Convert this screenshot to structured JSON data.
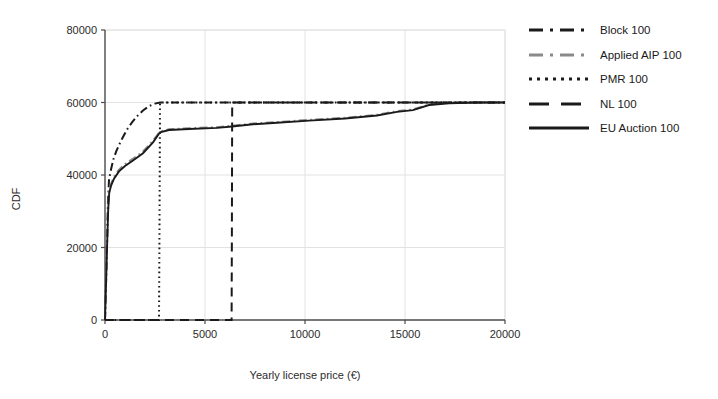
{
  "chart_data": {
    "type": "line",
    "title": "",
    "xlabel": "Yearly license price (€)",
    "ylabel": "CDF",
    "xlim": [
      0,
      20000
    ],
    "ylim": [
      0,
      80000
    ],
    "xticks": [
      0,
      5000,
      10000,
      15000,
      20000
    ],
    "yticks": [
      0,
      20000,
      40000,
      60000,
      80000
    ],
    "xtick_labels": [
      "0",
      "5000",
      "10000",
      "15000",
      "20000"
    ],
    "ytick_labels": [
      "0",
      "20000",
      "40000",
      "60000",
      "80000"
    ],
    "grid": true,
    "legend_position": "right",
    "series": [
      {
        "name": "Block 100",
        "style": "dashdot",
        "color": "#1a1a1a",
        "points": [
          [
            0,
            0
          ],
          [
            60,
            12000
          ],
          [
            110,
            24000
          ],
          [
            150,
            33000
          ],
          [
            200,
            38500
          ],
          [
            260,
            40500
          ],
          [
            340,
            42500
          ],
          [
            430,
            44500
          ],
          [
            560,
            46500
          ],
          [
            720,
            48500
          ],
          [
            900,
            50500
          ],
          [
            1100,
            52500
          ],
          [
            1350,
            54500
          ],
          [
            1600,
            56200
          ],
          [
            1900,
            57800
          ],
          [
            2200,
            59000
          ],
          [
            2500,
            59700
          ],
          [
            2750,
            60000
          ],
          [
            6350,
            60000
          ],
          [
            12000,
            60000
          ],
          [
            20000,
            60000
          ]
        ]
      },
      {
        "name": "Applied AIP 100",
        "style": "dashdot",
        "color": "#8a8a8a",
        "points": [
          [
            0,
            0
          ],
          [
            50,
            10000
          ],
          [
            110,
            22000
          ],
          [
            160,
            31000
          ],
          [
            210,
            35500
          ],
          [
            300,
            37500
          ],
          [
            450,
            39500
          ],
          [
            700,
            41500
          ],
          [
            1000,
            43000
          ],
          [
            1400,
            44500
          ],
          [
            1900,
            46500
          ],
          [
            2400,
            49500
          ],
          [
            2750,
            52000
          ],
          [
            3200,
            52600
          ],
          [
            4200,
            52900
          ],
          [
            5600,
            53200
          ],
          [
            6350,
            53600
          ],
          [
            7400,
            54200
          ],
          [
            8600,
            54600
          ],
          [
            10200,
            55200
          ],
          [
            12000,
            55800
          ],
          [
            13600,
            56600
          ],
          [
            14600,
            57600
          ],
          [
            15400,
            58100
          ],
          [
            16200,
            59400
          ],
          [
            17200,
            59900
          ],
          [
            18600,
            60000
          ],
          [
            20000,
            60000
          ]
        ]
      },
      {
        "name": "PMR 100",
        "style": "dotted",
        "color": "#1a1a1a",
        "points": [
          [
            0,
            0
          ],
          [
            2700,
            0
          ],
          [
            2720,
            20000
          ],
          [
            2740,
            45000
          ],
          [
            2750,
            60000
          ],
          [
            4000,
            60000
          ],
          [
            8000,
            60000
          ],
          [
            14000,
            60000
          ],
          [
            20000,
            60000
          ]
        ]
      },
      {
        "name": "NL 100",
        "style": "dashed",
        "color": "#1a1a1a",
        "points": [
          [
            0,
            0
          ],
          [
            6330,
            0
          ],
          [
            6345,
            25000
          ],
          [
            6355,
            50000
          ],
          [
            6360,
            60000
          ],
          [
            9000,
            60000
          ],
          [
            14000,
            60000
          ],
          [
            20000,
            60000
          ]
        ]
      },
      {
        "name": "EU Auction 100",
        "style": "solid",
        "color": "#1a1a1a",
        "points": [
          [
            0,
            0
          ],
          [
            50,
            9500
          ],
          [
            110,
            21500
          ],
          [
            160,
            30500
          ],
          [
            210,
            35000
          ],
          [
            300,
            37000
          ],
          [
            450,
            39000
          ],
          [
            700,
            41000
          ],
          [
            1000,
            42500
          ],
          [
            1400,
            44000
          ],
          [
            1900,
            46000
          ],
          [
            2400,
            49000
          ],
          [
            2750,
            51800
          ],
          [
            3200,
            52400
          ],
          [
            4200,
            52700
          ],
          [
            5600,
            53000
          ],
          [
            6350,
            53400
          ],
          [
            7400,
            54000
          ],
          [
            8600,
            54400
          ],
          [
            10200,
            55000
          ],
          [
            12000,
            55600
          ],
          [
            13600,
            56400
          ],
          [
            14600,
            57400
          ],
          [
            15400,
            57900
          ],
          [
            16200,
            59300
          ],
          [
            17200,
            59800
          ],
          [
            18600,
            60000
          ],
          [
            20000,
            60000
          ]
        ]
      }
    ]
  },
  "legend": {
    "items": [
      {
        "label": "Block 100",
        "style": "dashdot",
        "color": "#1a1a1a"
      },
      {
        "label": "Applied AIP 100",
        "style": "dashdot",
        "color": "#8a8a8a"
      },
      {
        "label": "PMR 100",
        "style": "dotted",
        "color": "#1a1a1a"
      },
      {
        "label": "NL 100",
        "style": "dashed",
        "color": "#1a1a1a"
      },
      {
        "label": "EU Auction 100",
        "style": "solid",
        "color": "#1a1a1a"
      }
    ]
  },
  "colors": {
    "background": "#ffffff",
    "axis": "#4a4a4a",
    "grid": "#e2e2e2",
    "text": "#1a1a1a"
  }
}
